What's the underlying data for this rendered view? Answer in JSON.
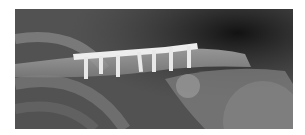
{
  "image": {
    "description": "Radiograph of clavicle with fixation plate and seven screws",
    "screw_count": 7,
    "colors": {
      "background": "#ffffff",
      "film_dark": "#1e1e1e",
      "film_mid": "#5a5a5a",
      "bone": "#9a9a9a",
      "hardware": "#ededed"
    }
  }
}
